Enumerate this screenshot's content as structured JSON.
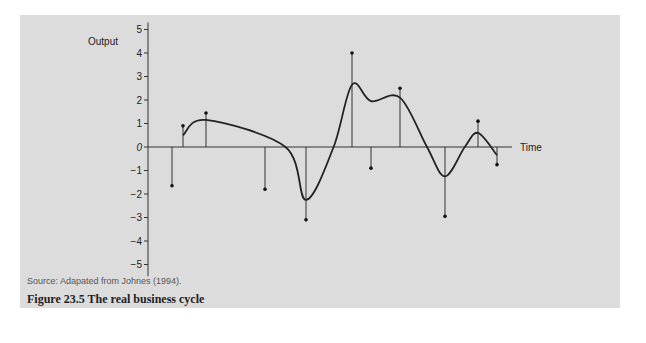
{
  "chart_data": {
    "type": "line",
    "title": "Figure 23.5 The real business cycle",
    "source": "Source: Adapated from Johnes (1994).",
    "xlabel": "Time",
    "ylabel": "Output",
    "ylim": [
      -5,
      5
    ],
    "yticks": [
      5,
      4,
      3,
      2,
      1,
      0,
      -1,
      -2,
      -3,
      -4,
      -5
    ],
    "ytick_labels": [
      "5",
      "4",
      "3",
      "2",
      "1",
      "0",
      "−1",
      "−2",
      "−3",
      "−4",
      "−5"
    ],
    "grid": false,
    "legend": null,
    "series": [
      {
        "name": "Shocks (stems)",
        "type": "stem",
        "x": [
          1,
          2,
          3,
          4,
          5,
          6,
          7,
          8,
          9,
          10,
          11
        ],
        "values": [
          -1.65,
          0.9,
          1.45,
          -1.8,
          -3.1,
          4.0,
          -0.9,
          2.5,
          -2.95,
          1.1,
          -0.75
        ]
      },
      {
        "name": "Output (smoothed cycle)",
        "type": "line",
        "points": [
          {
            "t": 2,
            "y": 0.5
          },
          {
            "t": 3,
            "y": 1.15
          },
          {
            "t": 4.5,
            "y": 0.0
          },
          {
            "t": 5,
            "y": -2.25
          },
          {
            "t": 5.6,
            "y": 0.0
          },
          {
            "t": 6,
            "y": 2.65
          },
          {
            "t": 7,
            "y": 1.95
          },
          {
            "t": 8,
            "y": 2.1
          },
          {
            "t": 8.6,
            "y": 0.0
          },
          {
            "t": 9,
            "y": -1.25
          },
          {
            "t": 9.6,
            "y": 0.0
          },
          {
            "t": 10,
            "y": 0.6
          },
          {
            "t": 11,
            "y": -0.35
          }
        ]
      }
    ]
  },
  "figure": {
    "source": "Source: Adapated from Johnes (1994).",
    "caption": "Figure 23.5  The real business cycle"
  },
  "colors": {
    "panel": "#dcdcdc",
    "ink": "#222222"
  }
}
